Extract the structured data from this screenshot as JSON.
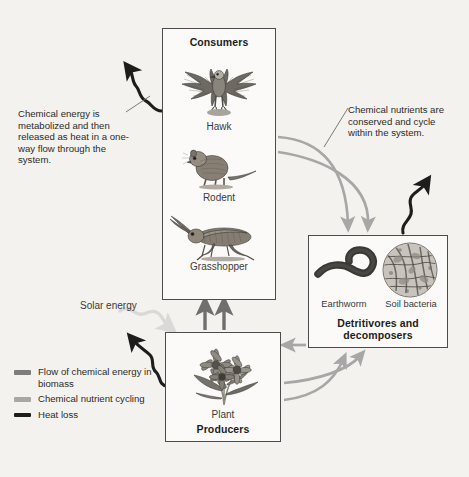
{
  "diagram": {
    "background_color": "#f4f2ee"
  },
  "boxes": {
    "consumers": {
      "title": "Consumers",
      "organisms": [
        {
          "label": "Hawk",
          "icon": "hawk-icon"
        },
        {
          "label": "Rodent",
          "icon": "rodent-icon"
        },
        {
          "label": "Grasshopper",
          "icon": "grasshopper-icon"
        }
      ]
    },
    "producers": {
      "title": "Producers",
      "organisms": [
        {
          "label": "Plant",
          "icon": "plant-icon"
        }
      ]
    },
    "detritivores": {
      "title": "Detritivores and decomposers",
      "title_line1": "Detritivores and",
      "title_line2": "decomposers",
      "organisms": [
        {
          "label": "Earthworm",
          "icon": "earthworm-icon"
        },
        {
          "label": "Soil bacteria",
          "icon": "soil-bacteria-icon"
        }
      ]
    }
  },
  "annotations": {
    "left": "Chemical energy is metabolized and then released as heat in a one-way flow through the system.",
    "right": "Chemical nutrients are conserved and cycle within the system.",
    "solar": "Solar energy"
  },
  "legend": {
    "items": [
      {
        "label": "Flow of chemical energy in biomass",
        "color": "#7d7d7d"
      },
      {
        "label": "Chemical nutrient cycling",
        "color": "#a7a7a7"
      },
      {
        "label": "Heat loss",
        "color": "#1d1d1b"
      }
    ]
  },
  "colors": {
    "biomass_arrow": "#7d7d7d",
    "nutrient_arrow": "#a7a7a7",
    "heat_arrow": "#1d1d1b",
    "solar_arrow": "#d9d9d9",
    "box_border": "#4c4c4c"
  }
}
